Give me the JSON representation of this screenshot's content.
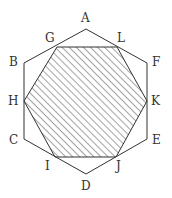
{
  "diagram": {
    "outer_octagon": {
      "vertices": [
        "A",
        "F",
        "E",
        "D",
        "C",
        "B"
      ],
      "points": {
        "A": [
          86,
          29
        ],
        "F": [
          147,
          63
        ],
        "E": [
          147,
          139
        ],
        "D": [
          86,
          174
        ],
        "C": [
          24,
          139
        ],
        "B": [
          24,
          63
        ]
      }
    },
    "shaded_hexagon": {
      "vertices": [
        "G",
        "L",
        "K",
        "J",
        "I",
        "H"
      ],
      "points": {
        "G": [
          57,
          47
        ],
        "L": [
          117,
          47
        ],
        "K": [
          147,
          101
        ],
        "J": [
          116,
          157
        ],
        "I": [
          55,
          157
        ],
        "H": [
          24,
          101
        ]
      },
      "fill": "hatched"
    },
    "labels": {
      "A": "A",
      "B": "B",
      "C": "C",
      "D": "D",
      "E": "E",
      "F": "F",
      "G": "G",
      "H": "H",
      "I": "I",
      "J": "J",
      "K": "K",
      "L": "L"
    },
    "colors": {
      "stroke": "#333333",
      "hatch": "#333333"
    }
  }
}
